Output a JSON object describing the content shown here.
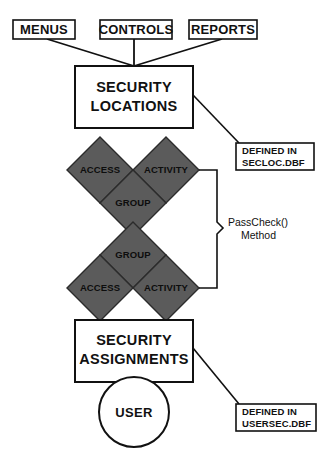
{
  "diagram": {
    "colors": {
      "diamond_fill": "#5b5b5b",
      "stroke": "#111111",
      "background": "#ffffff"
    },
    "top_inputs": [
      {
        "label": "MENUS"
      },
      {
        "label": "CONTROLS"
      },
      {
        "label": "REPORTS"
      }
    ],
    "security_locations": {
      "line1": "SECURITY",
      "line2": "LOCATIONS"
    },
    "security_assignments": {
      "line1": "SECURITY",
      "line2": "ASSIGNMENTS"
    },
    "user_node": {
      "label": "USER"
    },
    "upper_cluster": {
      "access": "ACCESS",
      "activity": "ACTIVITY",
      "group": "GROUP"
    },
    "lower_cluster": {
      "group": "GROUP",
      "access": "ACCESS",
      "activity": "ACTIVITY"
    },
    "method_annotation": {
      "line1": "PassCheck()",
      "line2": "Method"
    },
    "annotations": [
      {
        "name": "seclocation-defined-in",
        "line1": "DEFINED IN",
        "line2": "SECLOC.DBF"
      },
      {
        "name": "usersec-defined-in",
        "line1": "DEFINED IN",
        "line2": "USERSEC.DBF"
      }
    ]
  }
}
